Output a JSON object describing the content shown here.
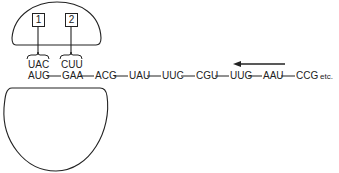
{
  "diagram": {
    "ribosome": {
      "small_subunit": "lower-ribosome-subunit",
      "large_subunit": "upper-ribosome-subunit"
    },
    "sites": [
      {
        "label": "1",
        "anticodon": "UAC"
      },
      {
        "label": "2",
        "anticodon": "CUU"
      }
    ],
    "mrna_codons": [
      "AUG",
      "GAA",
      "ACG",
      "UAU",
      "UUC",
      "CGU",
      "UUG",
      "AAU",
      "CCG"
    ],
    "trailing_text": "etc.",
    "arrow_direction": "left",
    "line_color": "#222222"
  }
}
